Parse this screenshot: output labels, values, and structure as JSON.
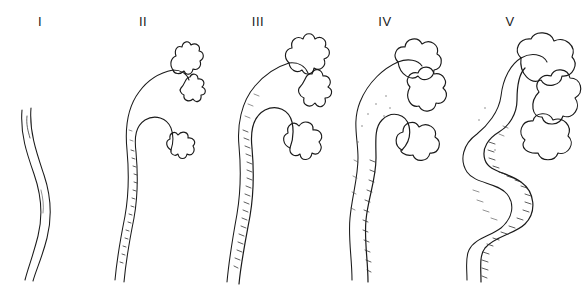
{
  "figure": {
    "background_color": "#ffffff",
    "ink_color": "#1a1a1a",
    "width": 587,
    "height": 301
  },
  "panels": [
    {
      "label": "I",
      "label_x": 40,
      "name": "grade-1",
      "caption": "Normal ureter: thin undulating tube, no pelvic or calyceal dilatation",
      "ureter_caliber": "normal",
      "calyces": "not shown",
      "shading": "none"
    },
    {
      "label": "II",
      "label_x": 143,
      "name": "grade-2",
      "caption": "Ureter and renal pelvis filled, sharp pointed calyces preserved",
      "ureter_caliber": "slightly full",
      "calyces": "sharp / cupped",
      "shading": "light"
    },
    {
      "label": "III",
      "label_x": 258,
      "name": "grade-3",
      "caption": "Mild to moderate dilatation of ureter and pelvis, slight blunting of calyceal fornices",
      "ureter_caliber": "mildly dilated",
      "calyces": "slightly blunted",
      "shading": "moderate"
    },
    {
      "label": "IV",
      "label_x": 385,
      "name": "grade-4",
      "caption": "Moderate dilatation and tortuosity of ureter, calyces rounded and clubbed",
      "ureter_caliber": "moderately dilated",
      "calyces": "rounded / clubbed",
      "shading": "moderate to heavy"
    },
    {
      "label": "V",
      "label_x": 510,
      "name": "grade-5",
      "caption": "Gross dilatation and tortuosity of ureter, papillary impressions lost in ballooned calyces",
      "ureter_caliber": "grossly dilated and tortuous",
      "calyces": "ballooned, papillary impressions lost",
      "shading": "heavy"
    }
  ]
}
